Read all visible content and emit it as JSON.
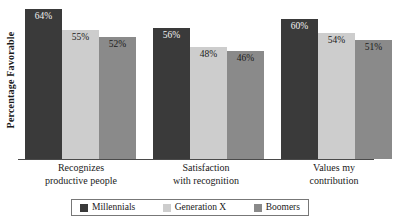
{
  "chart_data": {
    "type": "bar",
    "title": "",
    "subtitle": "",
    "xlabel": "",
    "ylabel": "Percentage Favorable",
    "ylim": [
      0,
      68
    ],
    "grid": false,
    "legend_position": "bottom",
    "categories": [
      "Recognizes productive people",
      "Satisfaction with recognition",
      "Values my contribution"
    ],
    "category_lines": [
      [
        "Recognizes",
        "productive people"
      ],
      [
        "Satisfaction",
        "with recognition"
      ],
      [
        "Values my",
        "contribution"
      ]
    ],
    "series": [
      {
        "name": "Millennials",
        "color": "#3a3a3a",
        "values": [
          64,
          56,
          60
        ],
        "labels": [
          "64%",
          "56%",
          "60%"
        ]
      },
      {
        "name": "Generation X",
        "color": "#cdcdcd",
        "values": [
          55,
          48,
          54
        ],
        "labels": [
          "55%",
          "48%",
          "54%"
        ]
      },
      {
        "name": "Boomers",
        "color": "#8a8a8a",
        "values": [
          52,
          46,
          51
        ],
        "labels": [
          "52%",
          "46%",
          "51%"
        ]
      }
    ]
  },
  "axis": {
    "y_title": "Percentage Favorable",
    "line_color": "#4a4a4a"
  },
  "legend": {
    "items": [
      {
        "label": "Millennials",
        "color": "#3a3a3a"
      },
      {
        "label": "Generation X",
        "color": "#cdcdcd"
      },
      {
        "label": "Boomers",
        "color": "#8a8a8a"
      }
    ]
  },
  "colors": {
    "background": "#ffffff",
    "text": "#1a1a1a",
    "legend_border": "#777777",
    "millennials": "#3a3a3a",
    "generation_x": "#cdcdcd",
    "boomers": "#8a8a8a"
  }
}
